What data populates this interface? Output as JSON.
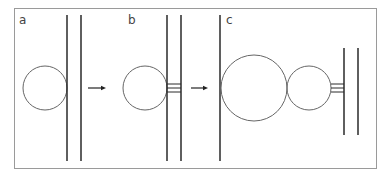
{
  "figure": {
    "panels": [
      {
        "id": "a",
        "label": "a"
      },
      {
        "id": "b",
        "label": "b"
      },
      {
        "id": "c",
        "label": "c"
      }
    ],
    "colors": {
      "frame": "#9a9a9a",
      "membrane": "#2a2a2a",
      "vesicle": "#666666",
      "arrow": "#222222",
      "background": "#ffffff"
    },
    "arrows": [
      {
        "from": "a",
        "to": "b"
      },
      {
        "from": "b",
        "to": "c"
      }
    ]
  }
}
